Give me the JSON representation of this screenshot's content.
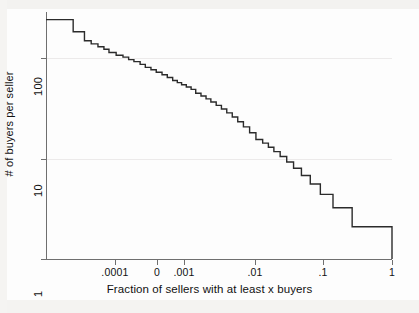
{
  "chart_data": {
    "type": "line",
    "title": "",
    "subtitle": "",
    "xlabel": "Fraction of sellers with at least x buyers",
    "ylabel": "# of buyers per seller",
    "xscale": "log",
    "yscale": "log",
    "xlim": [
      2.15e-05,
      1.0
    ],
    "ylim": [
      1,
      200
    ],
    "grid": "horizontal-faint",
    "legend": null,
    "x_tick_labels": [
      ".0001",
      "0",
      ".001",
      ".01",
      ".1",
      "1"
    ],
    "x_tick_values": [
      0.0001,
      0.0005,
      0.001,
      0.01,
      0.1,
      1
    ],
    "y_tick_labels": [
      "100",
      "10",
      "1"
    ],
    "y_tick_values": [
      100,
      10,
      1
    ],
    "series": [
      {
        "name": "buyers per seller survival curve",
        "style": "step",
        "color": "#2b2b2b",
        "points": [
          [
            2.15e-05,
            170
          ],
          [
            5e-05,
            170
          ],
          [
            5e-05,
            131
          ],
          [
            7.1e-05,
            131
          ],
          [
            7.1e-05,
            108
          ],
          [
            8.75e-05,
            108
          ],
          [
            8.75e-05,
            101
          ],
          [
            0.000108,
            101
          ],
          [
            0.000108,
            95
          ],
          [
            0.00013,
            95
          ],
          [
            0.00013,
            90
          ],
          [
            0.000152,
            90
          ],
          [
            0.000152,
            84
          ],
          [
            0.00019,
            84
          ],
          [
            0.00019,
            79
          ],
          [
            0.000235,
            79
          ],
          [
            0.000235,
            76
          ],
          [
            0.00028,
            76
          ],
          [
            0.00028,
            72
          ],
          [
            0.00033,
            72
          ],
          [
            0.00033,
            69
          ],
          [
            0.0004,
            69
          ],
          [
            0.0004,
            65
          ],
          [
            0.00047,
            65
          ],
          [
            0.00047,
            61
          ],
          [
            0.00056,
            61
          ],
          [
            0.00056,
            58
          ],
          [
            0.00066,
            58
          ],
          [
            0.00066,
            55
          ],
          [
            0.00079,
            55
          ],
          [
            0.00079,
            52
          ],
          [
            0.00093,
            52
          ],
          [
            0.00093,
            49
          ],
          [
            0.0011,
            49
          ],
          [
            0.0011,
            46
          ],
          [
            0.00127,
            46
          ],
          [
            0.00127,
            44
          ],
          [
            0.00145,
            44
          ],
          [
            0.00145,
            42
          ],
          [
            0.00168,
            42
          ],
          [
            0.00168,
            40
          ],
          [
            0.00195,
            40
          ],
          [
            0.00195,
            38
          ],
          [
            0.00225,
            38
          ],
          [
            0.00225,
            35
          ],
          [
            0.00265,
            35
          ],
          [
            0.00265,
            33
          ],
          [
            0.0031,
            33
          ],
          [
            0.0031,
            31
          ],
          [
            0.0036,
            31
          ],
          [
            0.0036,
            29
          ],
          [
            0.00425,
            29
          ],
          [
            0.00425,
            27
          ],
          [
            0.005,
            27
          ],
          [
            0.005,
            25
          ],
          [
            0.0059,
            25
          ],
          [
            0.0059,
            23
          ],
          [
            0.007,
            23
          ],
          [
            0.007,
            21
          ],
          [
            0.0083,
            21
          ],
          [
            0.0083,
            19
          ],
          [
            0.0099,
            19
          ],
          [
            0.0099,
            17
          ],
          [
            0.012,
            17
          ],
          [
            0.012,
            15
          ],
          [
            0.0146,
            15
          ],
          [
            0.0146,
            13
          ],
          [
            0.018,
            13
          ],
          [
            0.018,
            12
          ],
          [
            0.0215,
            12
          ],
          [
            0.0215,
            11,
            "step"
          ],
          [
            0.0255,
            11
          ],
          [
            0.0255,
            10
          ],
          [
            0.031,
            10
          ],
          [
            0.031,
            9
          ],
          [
            0.038,
            9
          ],
          [
            0.038,
            8
          ],
          [
            0.047,
            8
          ],
          [
            0.047,
            7
          ],
          [
            0.06,
            7
          ],
          [
            0.06,
            6
          ],
          [
            0.079,
            6
          ],
          [
            0.079,
            5
          ],
          [
            0.108,
            5
          ],
          [
            0.108,
            4
          ],
          [
            0.16,
            4
          ],
          [
            0.16,
            3
          ],
          [
            0.29,
            3
          ],
          [
            0.29,
            2
          ],
          [
            1.0,
            2
          ],
          [
            1.0,
            1
          ]
        ]
      }
    ]
  },
  "axes": {
    "y_title": "# of buyers per seller",
    "x_title": "Fraction of sellers with at least x buyers",
    "y_ticks": [
      {
        "label": "100",
        "value": 100
      },
      {
        "label": "10",
        "value": 10
      },
      {
        "label": "1",
        "value": 1
      }
    ],
    "x_ticks": [
      {
        "label": ".0001",
        "value": 0.0001
      },
      {
        "label": "0",
        "value": 0.0005
      },
      {
        "label": ".001",
        "value": 0.001
      },
      {
        "label": ".01",
        "value": 0.01
      },
      {
        "label": ".1",
        "value": 0.1
      },
      {
        "label": "1",
        "value": 1
      }
    ]
  },
  "style": {
    "line_color": "#2b2b2b",
    "axis_color": "#6f6f6f",
    "grid_color": "#eceaea",
    "background": "#fdfdfd",
    "text_color": "#111111"
  }
}
